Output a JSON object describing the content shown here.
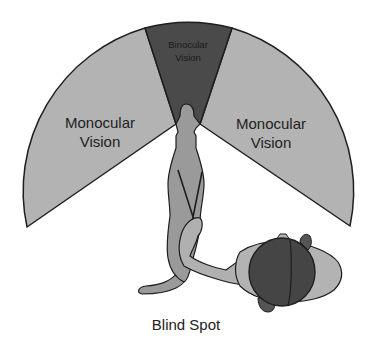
{
  "diagram": {
    "labels": {
      "binocular_line1": "Binocular",
      "binocular_line2": "Vision",
      "mono_left_line1": "Monocular",
      "mono_left_line2": "Vision",
      "mono_right_line1": "Monocular",
      "mono_right_line2": "Vision",
      "blind_spot": "Blind Spot"
    },
    "colors": {
      "background": "#ffffff",
      "monocular_fill": "#b3b3b3",
      "binocular_fill": "#4a4a4a",
      "outline": "#1e1e1e",
      "horse_fill": "#9a9a9a",
      "horse_light": "#b0b0b0",
      "helmet_fill": "#454545",
      "text": "#222222"
    }
  }
}
